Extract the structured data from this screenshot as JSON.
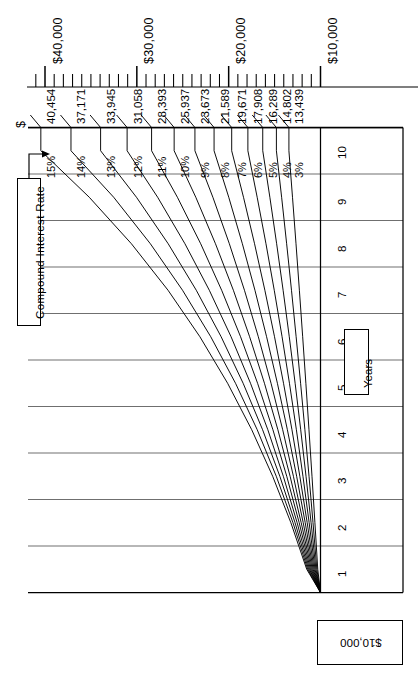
{
  "chart_data": {
    "type": "line",
    "title": "",
    "xlabel": "Years",
    "ylabel": "$",
    "orientation": "rotated-90ccw",
    "principal": 10000,
    "principal_label": "$10,000",
    "years": [
      1,
      2,
      3,
      4,
      5,
      6,
      7,
      8,
      9,
      10
    ],
    "value_axis_ticks": [
      10000,
      20000,
      30000,
      40000
    ],
    "value_axis_tick_labels": [
      "$10,000",
      "$20,000",
      "$30,000",
      "$40,000"
    ],
    "value_axis_minor_step": 1000,
    "value_axis_range": [
      9000,
      41500
    ],
    "grid": true,
    "legend_position": "inline-end-labels",
    "series": [
      {
        "name": "15%",
        "rate": 15,
        "final_value": 40454,
        "final_label": "40,454",
        "values": [
          11500,
          13225,
          15209,
          17490,
          20114,
          23131,
          26600,
          30590,
          35179,
          40454
        ]
      },
      {
        "name": "14%",
        "rate": 14,
        "final_value": 37171,
        "final_label": "37,171",
        "values": [
          11400,
          12996,
          14815,
          16890,
          19254,
          21950,
          25023,
          28526,
          32519,
          37171
        ]
      },
      {
        "name": "13%",
        "rate": 13,
        "final_value": 33945,
        "final_label": "33,945",
        "values": [
          11300,
          12769,
          14429,
          16305,
          18424,
          20820,
          23526,
          26584,
          30040,
          33945
        ]
      },
      {
        "name": "12%",
        "rate": 12,
        "final_value": 31058,
        "final_label": "31,058",
        "values": [
          11200,
          12544,
          14049,
          15735,
          17623,
          19738,
          22107,
          24760,
          27731,
          31058
        ]
      },
      {
        "name": "11%",
        "rate": 11,
        "final_value": 28393,
        "final_label": "28,393",
        "values": [
          11100,
          12321,
          13676,
          15181,
          16851,
          18704,
          20762,
          23045,
          25580,
          28394
        ]
      },
      {
        "name": "10%",
        "rate": 10,
        "final_value": 25937,
        "final_label": "25,937",
        "values": [
          11000,
          12100,
          13310,
          14641,
          16105,
          17716,
          19487,
          21436,
          23579,
          25937
        ]
      },
      {
        "name": "9%",
        "rate": 9,
        "final_value": 23673,
        "final_label": "23,673",
        "values": [
          10900,
          11881,
          12950,
          14116,
          15386,
          16771,
          18280,
          19926,
          21719,
          23674
        ]
      },
      {
        "name": "8%",
        "rate": 8,
        "final_value": 21589,
        "final_label": "21,589",
        "values": [
          10800,
          11664,
          12597,
          13605,
          14693,
          15869,
          17138,
          18509,
          19990,
          21589
        ]
      },
      {
        "name": "7%",
        "rate": 7,
        "final_value": 19671,
        "final_label": "19,671",
        "values": [
          10700,
          11449,
          12250,
          13108,
          14026,
          15007,
          16058,
          17182,
          18385,
          19672
        ]
      },
      {
        "name": "6%",
        "rate": 6,
        "final_value": 17908,
        "final_label": "17,908",
        "values": [
          10600,
          11236,
          11910,
          12625,
          13382,
          14185,
          15036,
          15938,
          16895,
          17908
        ]
      },
      {
        "name": "5%",
        "rate": 5,
        "final_value": 16289,
        "final_label": "16,289",
        "values": [
          10500,
          11025,
          11576,
          12155,
          12763,
          13401,
          14071,
          14775,
          15513,
          16289
        ]
      },
      {
        "name": "4%",
        "rate": 4,
        "final_value": 14802,
        "final_label": "14,802",
        "values": [
          10400,
          10816,
          11249,
          11699,
          12167,
          12653,
          13159,
          13686,
          14233,
          14802
        ]
      },
      {
        "name": "3%",
        "rate": 3,
        "final_value": 13439,
        "final_label": "13,439",
        "values": [
          10300,
          10609,
          10927,
          11255,
          11593,
          11941,
          12299,
          12668,
          13048,
          13439
        ]
      }
    ]
  },
  "axis": {
    "currency_symbol": "$",
    "tick_labels": [
      "$40,000",
      "$30,000",
      "$20,000",
      "$10,000"
    ],
    "value_labels": [
      "40,454",
      "37,171",
      "33,945",
      "31,058",
      "28,393",
      "25,937",
      "23,673",
      "21,589",
      "19,671",
      "17,908",
      "16,289",
      "14,802",
      "13,439"
    ],
    "rate_labels": [
      "15%",
      "14%",
      "13%",
      "12%",
      "11%",
      "10%",
      "9%",
      "8%",
      "7%",
      "6%",
      "5%",
      "4%",
      "3%"
    ],
    "year_labels": [
      "10",
      "9",
      "8",
      "7",
      "6",
      "5",
      "4",
      "3",
      "2",
      "1"
    ]
  },
  "annotations": {
    "compound_interest_rate": "Compound Interest Rate",
    "years": "Years",
    "starting_principal": "$10,000"
  },
  "colors": {
    "line": "#000000",
    "grid": "#555555",
    "background": "#ffffff",
    "text": "#000000"
  }
}
